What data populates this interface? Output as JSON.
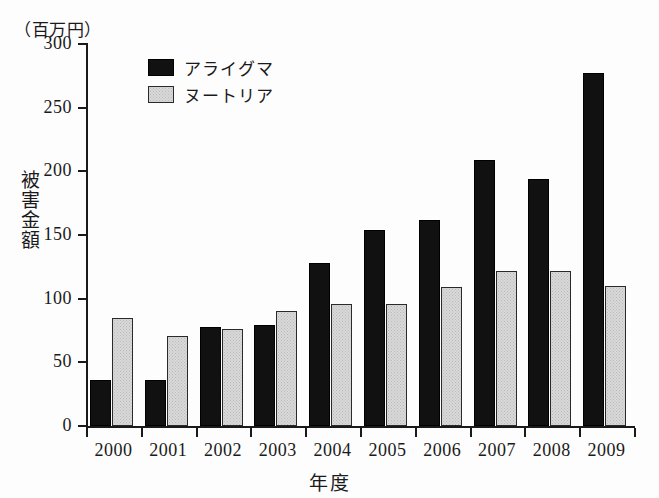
{
  "chart_data": {
    "type": "bar",
    "title": "",
    "unit_label": "（百万円）",
    "xlabel": "年度",
    "ylabel": "被害金額",
    "categories": [
      "2000",
      "2001",
      "2002",
      "2003",
      "2004",
      "2005",
      "2006",
      "2007",
      "2008",
      "2009"
    ],
    "series": [
      {
        "name": "アライグマ",
        "color": "#111111",
        "values": [
          36,
          36,
          78,
          79,
          128,
          154,
          162,
          209,
          194,
          277
        ]
      },
      {
        "name": "ヌートリア",
        "color": "#d9d9d9",
        "values": [
          85,
          71,
          76,
          90,
          96,
          96,
          109,
          122,
          122,
          110
        ]
      }
    ],
    "ylim": [
      0,
      300
    ],
    "yticks": [
      0,
      50,
      100,
      150,
      200,
      250,
      300
    ],
    "ytick_labels": [
      "0",
      "50",
      "100",
      "150",
      "200",
      "250",
      "300"
    ],
    "grid": false,
    "legend_position": "upper-left-inside"
  }
}
